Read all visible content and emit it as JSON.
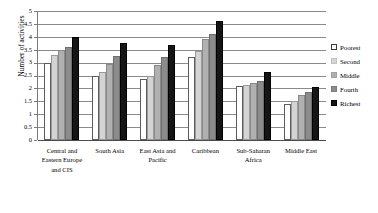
{
  "chart_data": {
    "type": "bar",
    "title": "",
    "xlabel": "",
    "ylabel": "Number of activities",
    "ylim": [
      0,
      5
    ],
    "ytick_step": 0.5,
    "yticks": [
      "5",
      "4.5",
      "4",
      "3.5",
      "3",
      "2.5",
      "2",
      "1.5",
      "1",
      "0.5",
      "0"
    ],
    "grid": true,
    "legend_position": "right",
    "categories": [
      "Central and Eastern Europe and CIS",
      "South Asia",
      "East Asia and Pacific",
      "Caribbean",
      "Sub-Saharan Africa",
      "Middle East"
    ],
    "series": [
      {
        "name": "Poorest",
        "color": "#ffffff",
        "values": [
          3.0,
          2.5,
          2.35,
          3.2,
          2.1,
          1.4
        ]
      },
      {
        "name": "Second",
        "color": "#d4d4d4",
        "values": [
          3.3,
          2.65,
          2.5,
          3.45,
          2.15,
          1.5
        ]
      },
      {
        "name": "Middle",
        "color": "#b0b0b0",
        "values": [
          3.5,
          2.95,
          2.9,
          3.9,
          2.2,
          1.75
        ]
      },
      {
        "name": "Fourth",
        "color": "#8c8c8c",
        "values": [
          3.6,
          3.25,
          3.2,
          4.1,
          2.3,
          1.85
        ]
      },
      {
        "name": "Richest",
        "color": "#151515",
        "values": [
          4.0,
          3.75,
          3.7,
          4.6,
          2.65,
          2.05
        ]
      }
    ]
  },
  "legend": {
    "items": [
      {
        "label": "Poorest"
      },
      {
        "label": "Second"
      },
      {
        "label": "Middle"
      },
      {
        "label": "Fourth"
      },
      {
        "label": "Richest"
      }
    ]
  },
  "axis": {
    "y_title": "Number of activities"
  }
}
